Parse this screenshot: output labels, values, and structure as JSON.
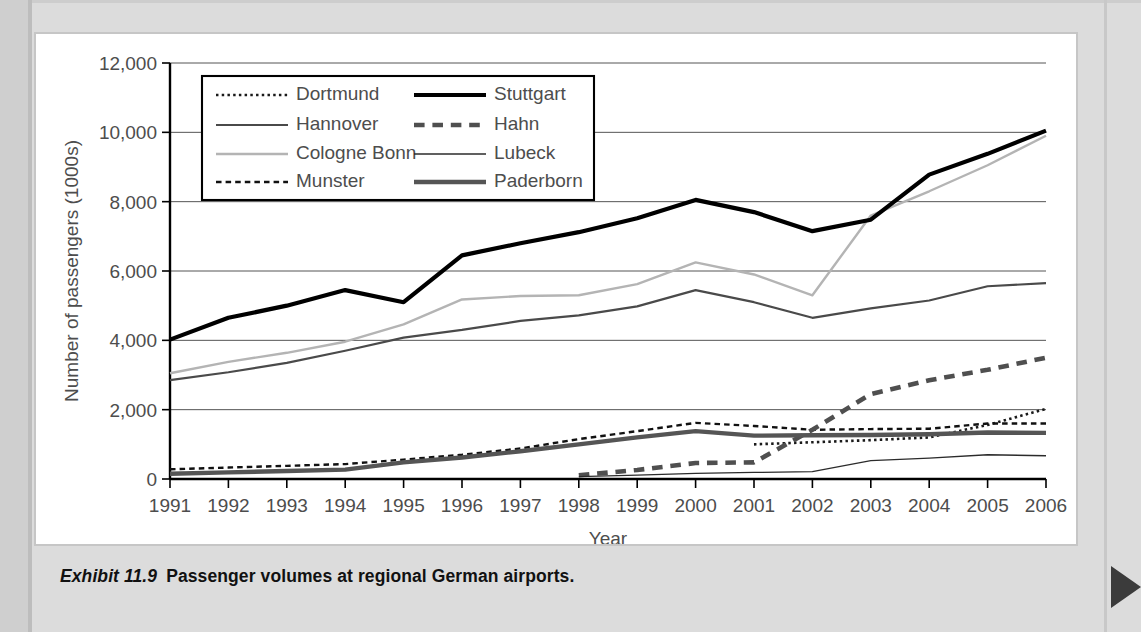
{
  "caption": {
    "exhibit_number": "Exhibit 11.9",
    "text": "Passenger volumes at regional German airports."
  },
  "chart_data": {
    "type": "line",
    "title": "",
    "xlabel": "Year",
    "ylabel": "Number of passengers (1000s)",
    "x": [
      1991,
      1992,
      1993,
      1994,
      1995,
      1996,
      1997,
      1998,
      1999,
      2000,
      2001,
      2002,
      2003,
      2004,
      2005,
      2006
    ],
    "xlim": [
      1991,
      2006
    ],
    "ylim": [
      0,
      12000
    ],
    "yticks": [
      0,
      2000,
      4000,
      6000,
      8000,
      10000,
      12000
    ],
    "ytick_labels": [
      "0",
      "2,000",
      "4,000",
      "6,000",
      "8,000",
      "10,000",
      "12,000"
    ],
    "xtick_labels": [
      "1991",
      "1992",
      "1993",
      "1994",
      "1995",
      "1996",
      "1997",
      "1998",
      "1999",
      "2000",
      "2001",
      "2002",
      "2003",
      "2004",
      "2005",
      "2006"
    ],
    "grid": "horizontal",
    "legend_position": "top-left-inside",
    "series": [
      {
        "name": "Dortmund",
        "style": "dotted",
        "color": "#1a1a1a",
        "width": 2.6,
        "start_year": 2001,
        "values": [
          null,
          null,
          null,
          null,
          null,
          null,
          null,
          null,
          null,
          null,
          1000,
          1060,
          1120,
          1200,
          1560,
          2020
        ]
      },
      {
        "name": "Hannover",
        "style": "solid",
        "color": "#4a4a4a",
        "width": 2.2,
        "start_year": 1991,
        "values": [
          2850,
          3080,
          3350,
          3700,
          4080,
          4300,
          4560,
          4720,
          4980,
          5450,
          5100,
          4650,
          4920,
          5150,
          5560,
          5650
        ]
      },
      {
        "name": "Cologne Bonn",
        "style": "solid",
        "color": "#b4b4b4",
        "width": 2.4,
        "start_year": 1991,
        "values": [
          3050,
          3380,
          3640,
          3960,
          4460,
          5180,
          5280,
          5300,
          5620,
          6250,
          5900,
          5300,
          7600,
          8300,
          9050,
          9900
        ]
      },
      {
        "name": "Munster",
        "style": "dashed",
        "color": "#111111",
        "width": 2.4,
        "start_year": 1991,
        "values": [
          280,
          330,
          380,
          430,
          560,
          700,
          880,
          1150,
          1380,
          1620,
          1530,
          1420,
          1440,
          1450,
          1600,
          1600
        ]
      },
      {
        "name": "Stuttgart",
        "style": "solid",
        "color": "#000000",
        "width": 4.2,
        "start_year": 1991,
        "values": [
          4020,
          4650,
          5000,
          5450,
          5100,
          6450,
          6800,
          7120,
          7520,
          8050,
          7700,
          7150,
          7480,
          8780,
          9380,
          10050
        ]
      },
      {
        "name": "Hahn",
        "style": "dashed",
        "color": "#4f4f4f",
        "width": 4.6,
        "start_year": 1998,
        "values": [
          null,
          null,
          null,
          null,
          null,
          null,
          null,
          110,
          260,
          460,
          480,
          1420,
          2450,
          2850,
          3150,
          3500
        ]
      },
      {
        "name": "Lubeck",
        "style": "solid",
        "color": "#2b2b2b",
        "width": 1.3,
        "start_year": 1998,
        "values": [
          null,
          null,
          null,
          null,
          null,
          null,
          null,
          70,
          110,
          160,
          190,
          210,
          530,
          600,
          700,
          670
        ]
      },
      {
        "name": "Paderborn",
        "style": "solid",
        "color": "#555555",
        "width": 4.4,
        "start_year": 1991,
        "values": [
          150,
          190,
          230,
          270,
          480,
          620,
          800,
          1000,
          1200,
          1380,
          1250,
          1260,
          1270,
          1290,
          1340,
          1330
        ]
      }
    ]
  },
  "legend": {
    "column_left": [
      "Dortmund",
      "Hannover",
      "Cologne Bonn",
      "Munster"
    ],
    "column_right": [
      "Stuttgart",
      "Hahn",
      "Lubeck",
      "Paderborn"
    ]
  },
  "colors": {
    "page_background": "#dcdcdc",
    "panel_background": "#ffffff",
    "plot_background": "#ffffff",
    "grid": "#555555",
    "axis": "#000000",
    "tick_label": "#4d4d4d"
  }
}
